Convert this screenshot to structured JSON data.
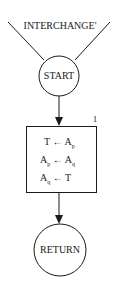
{
  "diagram": {
    "entry_label": "INTERCHANGE'",
    "start_label": "START",
    "process": {
      "number": "1",
      "lines": [
        {
          "lhs": "T",
          "arrow": "←",
          "rhs": "A",
          "rhs_sub": "p",
          "lhs_sub": ""
        },
        {
          "lhs": "A",
          "lhs_sub": "p",
          "arrow": "←",
          "rhs": "A",
          "rhs_sub": "q"
        },
        {
          "lhs": "A",
          "lhs_sub": "q",
          "arrow": "←",
          "rhs": "T",
          "rhs_sub": ""
        }
      ]
    },
    "end_label": "RETURN"
  }
}
